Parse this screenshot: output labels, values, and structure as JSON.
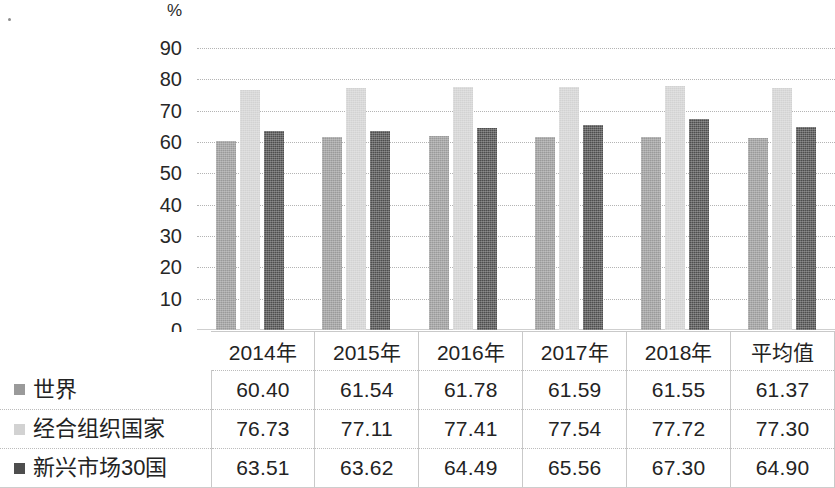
{
  "axis": {
    "unit_label": "%",
    "ticks": [
      "90",
      "80",
      "70",
      "60",
      "50",
      "40",
      "30",
      "20",
      "10",
      "0"
    ]
  },
  "colors": {
    "series_world": "#9a9a9a",
    "series_oecd": "#d2d2d2",
    "series_emerging": "#4e4e4e",
    "gridline": "#b4b4b4",
    "text": "#232323"
  },
  "table": {
    "columns": [
      "2014年",
      "2015年",
      "2016年",
      "2017年",
      "2018年",
      "平均值"
    ],
    "rows": [
      {
        "label": "世界",
        "swatch": "series_world",
        "values": [
          "60.40",
          "61.54",
          "61.78",
          "61.59",
          "61.55",
          "61.37"
        ]
      },
      {
        "label": "经合组织国家",
        "swatch": "series_oecd",
        "values": [
          "76.73",
          "77.11",
          "77.41",
          "77.54",
          "77.72",
          "77.30"
        ]
      },
      {
        "label": "新兴市场30国",
        "swatch": "series_emerging",
        "values": [
          "63.51",
          "63.62",
          "64.49",
          "65.56",
          "67.30",
          "64.90"
        ]
      }
    ]
  },
  "chart_data": {
    "type": "bar",
    "title": "",
    "xlabel": "",
    "ylabel": "%",
    "ylim": [
      0,
      90
    ],
    "ytick_step": 10,
    "grid": true,
    "legend_position": "table-row-labels",
    "categories": [
      "2014年",
      "2015年",
      "2016年",
      "2017年",
      "2018年",
      "平均值"
    ],
    "series": [
      {
        "name": "世界",
        "color": "#9a9a9a",
        "values": [
          60.4,
          61.54,
          61.78,
          61.59,
          61.55,
          61.37
        ]
      },
      {
        "name": "经合组织国家",
        "color": "#d2d2d2",
        "values": [
          76.73,
          77.11,
          77.41,
          77.54,
          77.72,
          77.3
        ]
      },
      {
        "name": "新兴市场30国",
        "color": "#4e4e4e",
        "values": [
          63.51,
          63.62,
          64.49,
          65.56,
          67.3,
          64.9
        ]
      }
    ]
  }
}
